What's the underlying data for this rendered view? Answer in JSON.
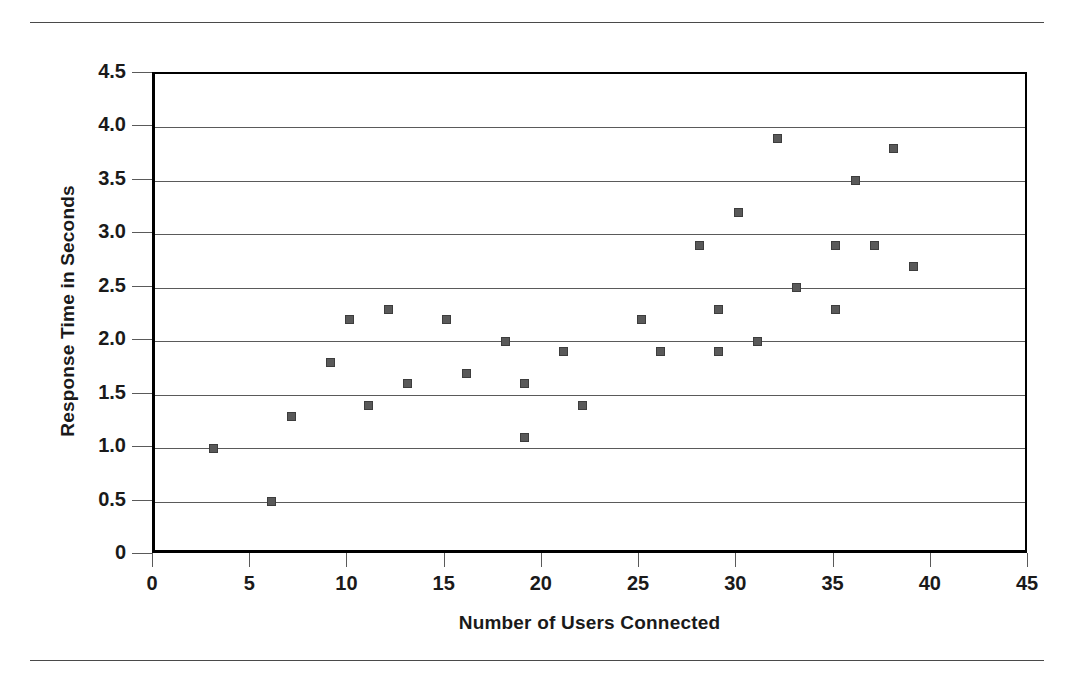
{
  "chart_data": {
    "type": "scatter",
    "title": "",
    "xlabel": "Number of Users Connected",
    "ylabel": "Response Time in Seconds",
    "xlim": [
      0,
      45
    ],
    "ylim": [
      0,
      4.5
    ],
    "xticks": [
      "0",
      "5",
      "10",
      "15",
      "20",
      "25",
      "30",
      "35",
      "40",
      "45"
    ],
    "xtick_values": [
      0,
      5,
      10,
      15,
      20,
      25,
      30,
      35,
      40,
      45
    ],
    "yticks": [
      "0",
      "0.5",
      "1.0",
      "1.5",
      "2.0",
      "2.5",
      "3.0",
      "3.5",
      "4.0",
      "4.5"
    ],
    "ytick_values": [
      0,
      0.5,
      1.0,
      1.5,
      2.0,
      2.5,
      3.0,
      3.5,
      4.0,
      4.5
    ],
    "grid": "horizontal",
    "legend": "none",
    "marker_color": "#595959",
    "marker_shape": "square",
    "points": [
      {
        "x": 3,
        "y": 1.0
      },
      {
        "x": 6,
        "y": 0.5
      },
      {
        "x": 7,
        "y": 1.3
      },
      {
        "x": 9,
        "y": 1.8
      },
      {
        "x": 10,
        "y": 2.2
      },
      {
        "x": 11,
        "y": 1.4
      },
      {
        "x": 12,
        "y": 2.3
      },
      {
        "x": 13,
        "y": 1.6
      },
      {
        "x": 15,
        "y": 2.2
      },
      {
        "x": 16,
        "y": 1.7
      },
      {
        "x": 18,
        "y": 2.0
      },
      {
        "x": 19,
        "y": 1.1
      },
      {
        "x": 19,
        "y": 1.6
      },
      {
        "x": 21,
        "y": 1.9
      },
      {
        "x": 22,
        "y": 1.4
      },
      {
        "x": 25,
        "y": 2.2
      },
      {
        "x": 26,
        "y": 1.9
      },
      {
        "x": 28,
        "y": 2.9
      },
      {
        "x": 29,
        "y": 2.3
      },
      {
        "x": 29,
        "y": 1.9
      },
      {
        "x": 30,
        "y": 3.2
      },
      {
        "x": 31,
        "y": 2.0
      },
      {
        "x": 32,
        "y": 3.9
      },
      {
        "x": 33,
        "y": 2.5
      },
      {
        "x": 35,
        "y": 2.9
      },
      {
        "x": 35,
        "y": 2.3
      },
      {
        "x": 36,
        "y": 3.5
      },
      {
        "x": 37,
        "y": 2.9
      },
      {
        "x": 38,
        "y": 3.8
      },
      {
        "x": 39,
        "y": 2.7
      }
    ]
  }
}
